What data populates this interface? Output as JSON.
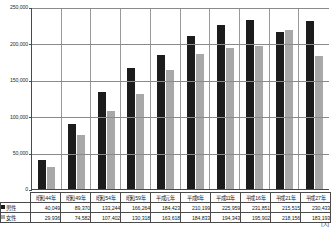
{
  "chart_data": {
    "type": "bar",
    "title": "",
    "xlabel": "",
    "ylabel": "",
    "unit_label": "[人]",
    "ylim": [
      0,
      250000
    ],
    "grid": true,
    "legend_position": "table-row-header",
    "categories": [
      "昭和44年",
      "昭和49年",
      "昭和54年",
      "昭和59年",
      "平成元年",
      "平成6年",
      "平成11年",
      "平成16年",
      "平成21年",
      "平成27年"
    ],
    "y_ticks": [
      "0",
      "50,000",
      "100,000",
      "150,000",
      "200,000",
      "250,000"
    ],
    "y_tick_values": [
      0,
      50000,
      100000,
      150000,
      200000,
      250000
    ],
    "series": [
      {
        "name": "男性",
        "color": "#1c1c1c",
        "values": [
          40049,
          89370,
          133244,
          166264,
          184423,
          210199,
          225959,
          231851,
          215515,
          230433
        ],
        "labels": [
          "40,049",
          "89,370",
          "133,244",
          "166,264",
          "184,423",
          "210,199",
          "225,959",
          "231,851",
          "215,515",
          "230,433"
        ]
      },
      {
        "name": "女性",
        "color": "#a8a8a8",
        "values": [
          29936,
          74582,
          107402,
          130318,
          163618,
          184833,
          194343,
          195902,
          218156,
          183193
        ],
        "labels": [
          "29,936",
          "74,582",
          "107,402",
          "130,318",
          "163,618",
          "184,833",
          "194,343",
          "195,902",
          "218,156",
          "183,193"
        ]
      }
    ]
  }
}
